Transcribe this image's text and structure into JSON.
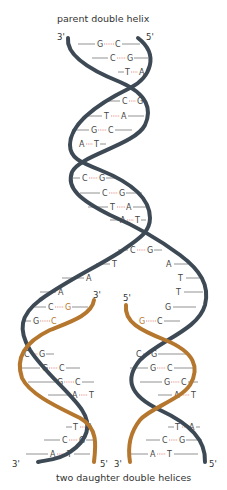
{
  "title_top": "parent double helix",
  "title_bottom": "two daughter double helices",
  "colors": {
    "parent_strand": "#3d4a55",
    "new_strand": "#b5762e",
    "hydrogen_bond": "#d9736b",
    "base_line": "#777777",
    "text": "#333333"
  },
  "labels": {
    "parent_left_end": "3'",
    "parent_right_end": "5'",
    "fork_left_new_end": "3'",
    "fork_right_new_end": "5'",
    "daughter_left_bottom_left": "3'",
    "daughter_left_bottom_right": "5'",
    "daughter_right_bottom_left": "3'",
    "daughter_right_bottom_right": "5'"
  },
  "parent_pairs": [
    {
      "left": "G",
      "right": "C"
    },
    {
      "left": "C",
      "right": "G"
    },
    {
      "left": "T",
      "right": "A"
    },
    {
      "left": "C",
      "right": "G"
    },
    {
      "left": "T",
      "right": "A"
    },
    {
      "left": "G",
      "right": "C"
    },
    {
      "left": "A",
      "right": "T"
    },
    {
      "left": "C",
      "right": "G"
    },
    {
      "left": "C",
      "right": "G"
    },
    {
      "left": "T",
      "right": "A"
    },
    {
      "left": "A",
      "right": "T"
    },
    {
      "left": "C",
      "right": "G"
    }
  ],
  "fork_unpaired": {
    "left": [
      "T",
      "A",
      "A"
    ],
    "right": [
      "A",
      "T",
      "T"
    ]
  },
  "left_daughter_pairs": [
    {
      "left": "C",
      "right": "G"
    },
    {
      "left": "G",
      "right": "C"
    },
    {
      "left": "C",
      "right": "G"
    },
    {
      "left": "G",
      "right": "C"
    },
    {
      "left": "G",
      "right": "C"
    },
    {
      "left": "A",
      "right": "T"
    },
    {
      "left": "T",
      "right": "A"
    },
    {
      "left": "C",
      "right": "G"
    },
    {
      "left": "A",
      "right": "T"
    }
  ],
  "right_daughter_pairs": [
    {
      "left": "G",
      "right": ""
    },
    {
      "left": "G",
      "right": "C"
    },
    {
      "left": "C",
      "right": "G"
    },
    {
      "left": "G",
      "right": "C"
    },
    {
      "left": "G",
      "right": "C"
    },
    {
      "left": "A",
      "right": "T"
    },
    {
      "left": "T",
      "right": "A"
    },
    {
      "left": "C",
      "right": "G"
    },
    {
      "left": "A",
      "right": "T"
    }
  ]
}
